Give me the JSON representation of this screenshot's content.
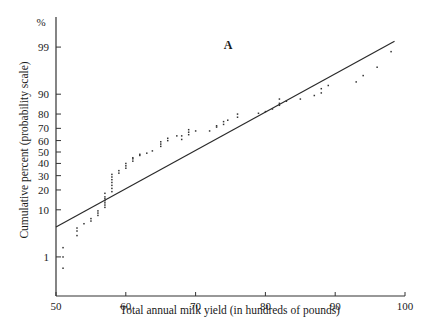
{
  "chart_data": {
    "type": "scatter",
    "title": "",
    "panel_label": "A",
    "xlabel": "Total annual milk yield (in hundreds of pounds)",
    "ylabel": "Cumulative percent (probability scale)",
    "y_unit_label": "%",
    "xlim": [
      50,
      100
    ],
    "x_ticks": [
      50,
      60,
      70,
      80,
      90,
      100
    ],
    "y_scale": "probability",
    "y_ticks": [
      1,
      10,
      20,
      30,
      40,
      50,
      60,
      70,
      80,
      90,
      99
    ],
    "grid": false,
    "legend": null,
    "fitted_line": {
      "x": [
        50,
        98.5
      ],
      "y_percent": [
        4.8,
        99.3
      ]
    },
    "series": [
      {
        "name": "observed",
        "points": [
          [
            51,
            1.7
          ],
          [
            51,
            1.0
          ],
          [
            51,
            0.5
          ],
          [
            53,
            3.2
          ],
          [
            53,
            4.0
          ],
          [
            53,
            4.6
          ],
          [
            54,
            5.6
          ],
          [
            55,
            6.3
          ],
          [
            55,
            7.0
          ],
          [
            56,
            8.0
          ],
          [
            56,
            8.8
          ],
          [
            56,
            9.6
          ],
          [
            57,
            11
          ],
          [
            57,
            12
          ],
          [
            57,
            13
          ],
          [
            57,
            14
          ],
          [
            57,
            15
          ],
          [
            57,
            16
          ],
          [
            57,
            18
          ],
          [
            58,
            19
          ],
          [
            58,
            21
          ],
          [
            58,
            23
          ],
          [
            58,
            25
          ],
          [
            58,
            27
          ],
          [
            58,
            29
          ],
          [
            58,
            31
          ],
          [
            59,
            32
          ],
          [
            59,
            34
          ],
          [
            60,
            36
          ],
          [
            60,
            38
          ],
          [
            60,
            40
          ],
          [
            61,
            42
          ],
          [
            61,
            44
          ],
          [
            61,
            45
          ],
          [
            62,
            47
          ],
          [
            62,
            48
          ],
          [
            63,
            49
          ],
          [
            63.8,
            51
          ],
          [
            65,
            55
          ],
          [
            65,
            57
          ],
          [
            65,
            59
          ],
          [
            66,
            60
          ],
          [
            66,
            62
          ],
          [
            67.3,
            64
          ],
          [
            68,
            61
          ],
          [
            68,
            64
          ],
          [
            69,
            65
          ],
          [
            69,
            67
          ],
          [
            69,
            69
          ],
          [
            70,
            68
          ],
          [
            72,
            68
          ],
          [
            73,
            71
          ],
          [
            73,
            72
          ],
          [
            74,
            73
          ],
          [
            74,
            75
          ],
          [
            74.6,
            76
          ],
          [
            76,
            78
          ],
          [
            76,
            80
          ],
          [
            79,
            80.5
          ],
          [
            80,
            81.5
          ],
          [
            81,
            83
          ],
          [
            82,
            85
          ],
          [
            82,
            86
          ],
          [
            82,
            88
          ],
          [
            83,
            87
          ],
          [
            85,
            88
          ],
          [
            87,
            89.5
          ],
          [
            88,
            90.5
          ],
          [
            88,
            92
          ],
          [
            89,
            93
          ],
          [
            93,
            94
          ],
          [
            94,
            95.5
          ],
          [
            96,
            97
          ],
          [
            98,
            98.7
          ]
        ]
      }
    ]
  }
}
